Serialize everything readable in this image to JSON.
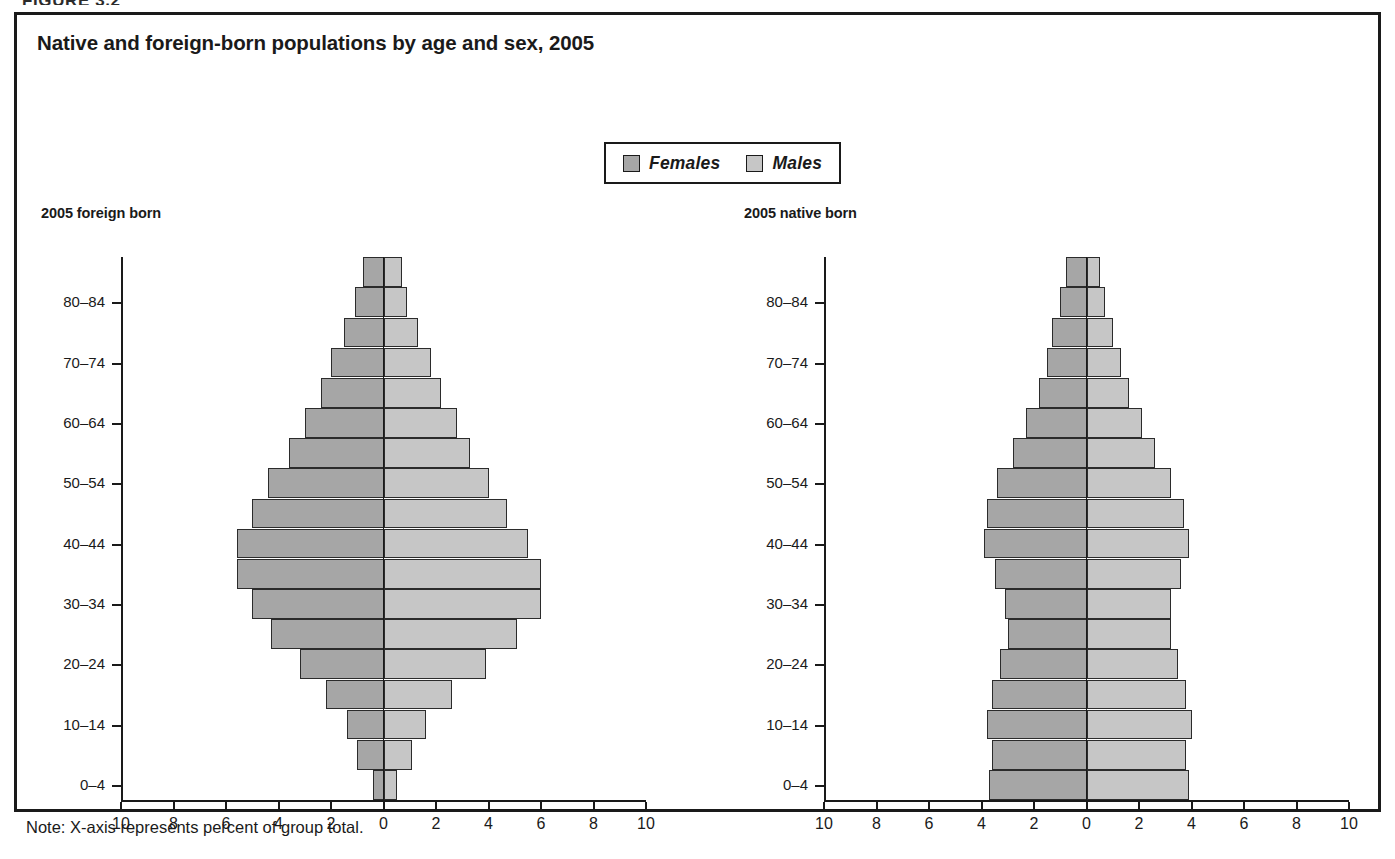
{
  "figure": {
    "kicker": "FIGURE 3.2",
    "title": "Native and foreign-born populations by age and sex, 2005",
    "note": "Note:  X-axis represents percent of group total."
  },
  "legend": {
    "items": [
      {
        "label": "Females",
        "color": "#a6a6a6"
      },
      {
        "label": "Males",
        "color": "#c6c6c6"
      }
    ]
  },
  "panels": {
    "left": {
      "subtitle": "2005 foreign born"
    },
    "right": {
      "subtitle": "2005 native born"
    }
  },
  "axis": {
    "x_ticks": [
      "10",
      "8",
      "6",
      "4",
      "2",
      "0",
      "2",
      "4",
      "6",
      "8",
      "10"
    ],
    "x_tick_values": [
      -10,
      -8,
      -6,
      -4,
      -2,
      0,
      2,
      4,
      6,
      8,
      10
    ],
    "y_tick_labels": [
      "0–4",
      "10–14",
      "20–24",
      "30–34",
      "40–44",
      "50–54",
      "60–64",
      "70–74",
      "80–84"
    ],
    "y_tick_bands": [
      "0-4",
      "10-14",
      "20-24",
      "30-34",
      "40-44",
      "50-54",
      "60-64",
      "70-74",
      "80-84"
    ],
    "xlim": [
      -10,
      10
    ],
    "xlabel": "",
    "ylabel": ""
  },
  "chart_data": [
    {
      "type": "bar",
      "subtype": "population-pyramid",
      "title": "2005 foreign born",
      "xlabel": "Percent of group total",
      "ylabel": "Age group",
      "xlim": [
        -10,
        10
      ],
      "grid": false,
      "legend_position": "top-center",
      "categories": [
        "0-4",
        "5-9",
        "10-14",
        "15-19",
        "20-24",
        "25-29",
        "30-34",
        "35-39",
        "40-44",
        "45-49",
        "50-54",
        "55-59",
        "60-64",
        "65-69",
        "70-74",
        "75-79",
        "80-84",
        "85+"
      ],
      "series": [
        {
          "name": "Females",
          "side": "left",
          "values": [
            0.4,
            1.0,
            1.4,
            2.2,
            3.2,
            4.3,
            5.0,
            5.6,
            5.6,
            5.0,
            4.4,
            3.6,
            3.0,
            2.4,
            2.0,
            1.5,
            1.1,
            0.8
          ]
        },
        {
          "name": "Males",
          "side": "right",
          "values": [
            0.5,
            1.1,
            1.6,
            2.6,
            3.9,
            5.1,
            6.0,
            6.0,
            5.5,
            4.7,
            4.0,
            3.3,
            2.8,
            2.2,
            1.8,
            1.3,
            0.9,
            0.7
          ]
        }
      ]
    },
    {
      "type": "bar",
      "subtype": "population-pyramid",
      "title": "2005 native born",
      "xlabel": "Percent of group total",
      "ylabel": "Age group",
      "xlim": [
        -10,
        10
      ],
      "grid": false,
      "legend_position": "top-center",
      "categories": [
        "0-4",
        "5-9",
        "10-14",
        "15-19",
        "20-24",
        "25-29",
        "30-34",
        "35-39",
        "40-44",
        "45-49",
        "50-54",
        "55-59",
        "60-64",
        "65-69",
        "70-74",
        "75-79",
        "80-84",
        "85+"
      ],
      "series": [
        {
          "name": "Females",
          "side": "left",
          "values": [
            3.7,
            3.6,
            3.8,
            3.6,
            3.3,
            3.0,
            3.1,
            3.5,
            3.9,
            3.8,
            3.4,
            2.8,
            2.3,
            1.8,
            1.5,
            1.3,
            1.0,
            0.8
          ]
        },
        {
          "name": "Males",
          "side": "right",
          "values": [
            3.9,
            3.8,
            4.0,
            3.8,
            3.5,
            3.2,
            3.2,
            3.6,
            3.9,
            3.7,
            3.2,
            2.6,
            2.1,
            1.6,
            1.3,
            1.0,
            0.7,
            0.5
          ]
        }
      ]
    }
  ]
}
